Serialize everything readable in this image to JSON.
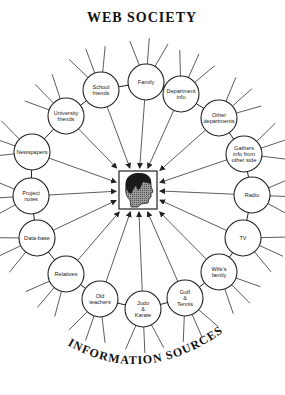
{
  "title": "WEB SOCIETY",
  "subtitle": "INFORMATION SOURCES",
  "center": {
    "label": "person-head",
    "box": {
      "x": 119,
      "y": 171,
      "w": 38,
      "h": 38
    }
  },
  "colors": {
    "stroke": "#222222",
    "background": "#ffffff",
    "face": "#888888",
    "hair": "#1a1a1a"
  },
  "nodes": [
    {
      "id": "family",
      "lines": [
        "Family"
      ],
      "x": 146,
      "y": 82
    },
    {
      "id": "department-info",
      "lines": [
        "Department",
        "info"
      ],
      "x": 181,
      "y": 94
    },
    {
      "id": "other-departments",
      "lines": [
        "Other",
        "departments"
      ],
      "x": 219,
      "y": 118
    },
    {
      "id": "gathers-info",
      "lines": [
        "Gathers",
        "info from",
        "other side"
      ],
      "x": 244,
      "y": 154
    },
    {
      "id": "radio",
      "lines": [
        "Radio"
      ],
      "x": 252,
      "y": 195
    },
    {
      "id": "tv",
      "lines": [
        "TV"
      ],
      "x": 243,
      "y": 238
    },
    {
      "id": "wifes-family",
      "lines": [
        "Wife's",
        "family"
      ],
      "x": 219,
      "y": 272
    },
    {
      "id": "golf-tennis",
      "lines": [
        "Golf",
        "&",
        "Tennis"
      ],
      "x": 185,
      "y": 298
    },
    {
      "id": "judo-karate",
      "lines": [
        "Judo",
        "&",
        "Karate"
      ],
      "x": 143,
      "y": 309
    },
    {
      "id": "old-teachers",
      "lines": [
        "Old",
        "teachers"
      ],
      "x": 100,
      "y": 299
    },
    {
      "id": "relatives",
      "lines": [
        "Relatives"
      ],
      "x": 66,
      "y": 274
    },
    {
      "id": "data-base",
      "lines": [
        "Data-base"
      ],
      "x": 37,
      "y": 238
    },
    {
      "id": "project-notes",
      "lines": [
        "Project",
        "notes"
      ],
      "x": 31,
      "y": 196
    },
    {
      "id": "newspapers",
      "lines": [
        "Newspapers"
      ],
      "x": 32,
      "y": 152
    },
    {
      "id": "university-friends",
      "lines": [
        "University",
        "friends"
      ],
      "x": 66,
      "y": 116
    },
    {
      "id": "school-friends",
      "lines": [
        "School",
        "friends"
      ],
      "x": 101,
      "y": 90
    }
  ]
}
